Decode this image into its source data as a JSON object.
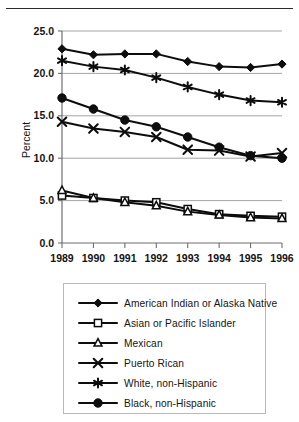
{
  "figure": {
    "has_top_rule": true,
    "background": "#ffffff",
    "ink_color": "#0d0d0d",
    "grid_color": "#9a9a9a"
  },
  "chart_data": {
    "type": "line",
    "title": "",
    "subtitle": "",
    "xlabel": "",
    "ylabel": "Percent",
    "categories": [
      "1989",
      "1990",
      "1991",
      "1992",
      "1993",
      "1994",
      "1995",
      "1996"
    ],
    "x": [
      1989,
      1990,
      1991,
      1992,
      1993,
      1994,
      1995,
      1996
    ],
    "ylim": [
      0.0,
      25.0
    ],
    "ytick_values": [
      0.0,
      5.0,
      10.0,
      15.0,
      20.0,
      25.0
    ],
    "ytick_labels": [
      "0.0",
      "5.0",
      "10.0",
      "15.0",
      "20.0",
      "25.0"
    ],
    "grid": "horizontal",
    "legend_position": "below",
    "series": [
      {
        "name": "American Indian or Alaska Native",
        "marker": "filled-diamond",
        "values": [
          22.9,
          22.2,
          22.3,
          22.3,
          21.4,
          20.8,
          20.7,
          21.1
        ]
      },
      {
        "name": "Asian or Pacific Islander",
        "marker": "open-square",
        "values": [
          5.6,
          5.3,
          5.0,
          4.8,
          4.0,
          3.4,
          3.2,
          3.1
        ]
      },
      {
        "name": "Mexican",
        "marker": "open-triangle",
        "values": [
          6.2,
          5.3,
          4.8,
          4.4,
          3.7,
          3.3,
          3.0,
          2.9
        ]
      },
      {
        "name": "Puerto Rican",
        "marker": "x-cross",
        "values": [
          14.3,
          13.5,
          13.1,
          12.5,
          11.0,
          10.9,
          10.2,
          10.6
        ]
      },
      {
        "name": "White, non-Hispanic",
        "marker": "asterisk",
        "values": [
          21.5,
          20.8,
          20.4,
          19.5,
          18.4,
          17.5,
          16.8,
          16.6
        ]
      },
      {
        "name": "Black, non-Hispanic",
        "marker": "filled-circle",
        "values": [
          17.1,
          15.8,
          14.5,
          13.7,
          12.5,
          11.3,
          10.3,
          10.0
        ]
      }
    ]
  },
  "legend": {
    "items": [
      {
        "label": "American Indian or Alaska Native",
        "marker": "filled-diamond"
      },
      {
        "label": "Asian or Pacific Islander",
        "marker": "open-square"
      },
      {
        "label": "Mexican",
        "marker": "open-triangle"
      },
      {
        "label": "Puerto Rican",
        "marker": "x-cross"
      },
      {
        "label": "White, non-Hispanic",
        "marker": "asterisk"
      },
      {
        "label": "Black, non-Hispanic",
        "marker": "filled-circle"
      }
    ]
  }
}
